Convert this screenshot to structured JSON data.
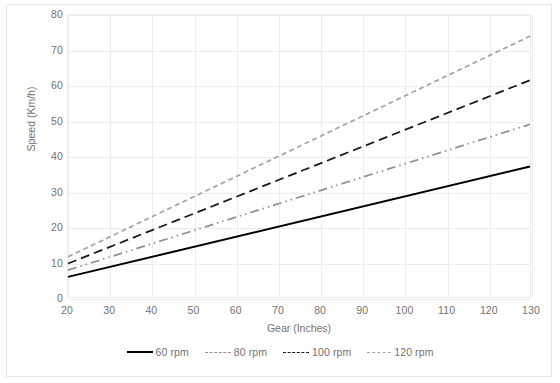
{
  "chart_data": {
    "type": "line",
    "title": "",
    "xlabel": "Gear (Inches)",
    "ylabel": "Speed (Km/h)",
    "xlim": [
      20,
      130
    ],
    "ylim": [
      0,
      80
    ],
    "xticks": [
      20,
      30,
      40,
      50,
      60,
      70,
      80,
      90,
      100,
      110,
      120,
      130
    ],
    "yticks": [
      0,
      10,
      20,
      30,
      40,
      50,
      60,
      70,
      80
    ],
    "grid": "both",
    "legend_position": "bottom",
    "x": [
      20,
      130
    ],
    "series": [
      {
        "name": "60 rpm",
        "values": [
          5.7,
          37.0
        ],
        "color": "#000000",
        "dash": "none",
        "width": 2.0
      },
      {
        "name": "80 rpm",
        "values": [
          7.6,
          49.0
        ],
        "color": "#919191",
        "dash": "dashdotdot",
        "width": 1.8
      },
      {
        "name": "100 rpm",
        "values": [
          9.5,
          61.5
        ],
        "color": "#1a1a1a",
        "dash": "dash",
        "width": 1.8
      },
      {
        "name": "120 rpm",
        "values": [
          11.4,
          74.0
        ],
        "color": "#a6a6a6",
        "dash": "shortdash",
        "width": 1.8
      }
    ]
  },
  "legend": {
    "items": [
      {
        "label": "60 rpm"
      },
      {
        "label": "80 rpm"
      },
      {
        "label": "100 rpm"
      },
      {
        "label": "120 rpm"
      }
    ]
  },
  "colors": {
    "grid": "#eceded",
    "text": "#767171",
    "border": "#e8e8e8",
    "background": "#ffffff"
  }
}
